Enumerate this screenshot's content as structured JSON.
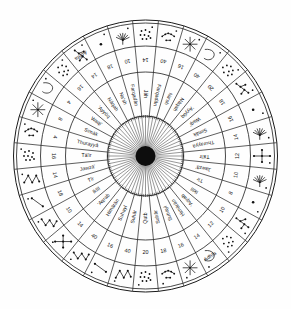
{
  "figure": {
    "type": "star-compass-diagram",
    "center_label": "",
    "background_color": "#ffffff",
    "line_color": "#1a1a1a",
    "text_color": "#101010",
    "ring_count": 3,
    "rhumb_count": 32
  },
  "rings": {
    "inner_ring_name": "star-name-ring",
    "middle_ring_name": "degree-number-ring",
    "outer_ring_name": "constellation-glyph-ring"
  },
  "star_names": {
    "north": "Jāh",
    "south": "Qutb",
    "north_sequence_ccw": [
      "Jāh",
      "Farqadān",
      "Na'sh",
      "Nāqah",
      "'Ayyūq",
      "Waqi'",
      "Simāk",
      "Thurayyā",
      "Tā'ir",
      "Jawzā'",
      "Tīr",
      "Iklīl",
      "'Aqrab",
      "Ḥimārān",
      "Suhayl",
      "Suhār",
      "Qutb"
    ],
    "north_sequence_cw": [
      "Jāh",
      "Farqadān",
      "Na'sh",
      "Nāqah",
      "'Ayyūq",
      "Waqi'",
      "Simāk",
      "Thurayyā",
      "Tā'ir",
      "Jawzā'",
      "Tīr",
      "Iklīl",
      "'Aqrab",
      "Ḥimārān",
      "Suhayl",
      "Suhār",
      "Qutb"
    ]
  },
  "numbers": {
    "west_column_top_to_bottom": [
      "10",
      "18",
      "14",
      "16",
      "4",
      "8",
      "4",
      "16",
      "14",
      "18",
      "10"
    ],
    "east_column_top_to_bottom": [
      "20",
      "18",
      "16",
      "14",
      "12",
      "10",
      "8",
      "10",
      "12",
      "14",
      "16"
    ],
    "top_arc_left_to_right": [
      "14",
      "40",
      "16",
      "40",
      "20"
    ],
    "bottom_arc_left_to_right": [
      "10",
      "14",
      "40",
      "16",
      "40",
      "20"
    ],
    "all_values": [
      "4",
      "8",
      "10",
      "12",
      "14",
      "16",
      "18",
      "20",
      "40"
    ]
  },
  "outer_ring": {
    "named_segment_top": "Adhfa",
    "named_segment_bottom": "Adhfa",
    "glyph_names": [
      "star-cluster-pleiades",
      "star-arc-three",
      "star-asterisk-eight-ray",
      "star-hook-curve",
      "star-cluster-scatter",
      "star-chain-branch",
      "star-dot-single",
      "star-spider-radial",
      "star-cross-anchor",
      "star-spider-radial",
      "star-dot-single",
      "star-chain-branch",
      "star-cluster-scatter",
      "star-hook-curve",
      "star-asterisk-eight-ray",
      "star-arc-three",
      "star-cluster-pleiades",
      "star-zigzag-chain",
      "star-line-pair",
      "star-vee-chain",
      "star-cross-anchor",
      "star-vee-chain",
      "star-line-pair",
      "star-zigzag-chain"
    ]
  },
  "hub": {
    "spoke_count": 64,
    "fill_color": "#0d0d0d",
    "radius_px": 10
  }
}
